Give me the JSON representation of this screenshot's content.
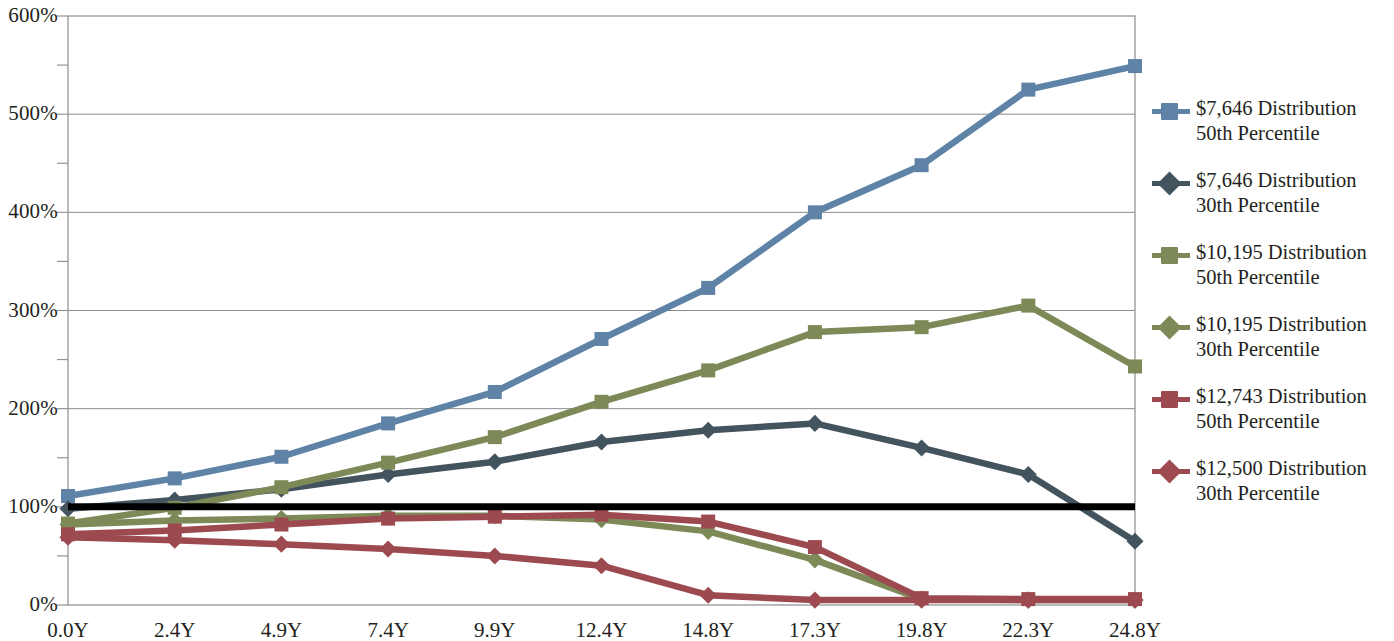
{
  "chart_data": {
    "type": "line",
    "title": "",
    "subtitle": "",
    "xlabel": "",
    "ylabel": "",
    "grid": true,
    "legend_position": "right",
    "ylim": [
      0,
      600
    ],
    "y_unit": "%",
    "y_ticks": [
      "0%",
      "100%",
      "200%",
      "300%",
      "400%",
      "500%",
      "600%"
    ],
    "y_tick_values": [
      0,
      100,
      200,
      300,
      400,
      500,
      600
    ],
    "y_minor_ticks": [
      50,
      150,
      250,
      350,
      450,
      550
    ],
    "categories": [
      "0.0Y",
      "2.4Y",
      "4.9Y",
      "7.4Y",
      "9.9Y",
      "12.4Y",
      "14.8Y",
      "17.3Y",
      "19.8Y",
      "22.3Y",
      "24.8Y"
    ],
    "reference_line": {
      "value": 100,
      "label": "100%",
      "color": "#000000"
    },
    "series": [
      {
        "name": "$7,646 Distribution 50th Percentile",
        "legend_line1": "$7,646 Distribution",
        "legend_line2": "50th Percentile",
        "color": "#5e83a6",
        "marker": "square",
        "values": [
          111,
          129,
          151,
          185,
          217,
          271,
          323,
          400,
          448,
          525,
          549
        ]
      },
      {
        "name": "$7,646 Distribution 30th Percentile",
        "legend_line1": "$7,646 Distribution",
        "legend_line2": "30th Percentile",
        "color": "#44545f",
        "marker": "diamond",
        "values": [
          98,
          107,
          118,
          133,
          146,
          166,
          178,
          185,
          160,
          133,
          65
        ]
      },
      {
        "name": "$10,195 Distribution 50th Percentile",
        "legend_line1": "$10,195 Distribution",
        "legend_line2": "50th Percentile",
        "color": "#7d8a58",
        "marker": "square",
        "values": [
          83,
          99,
          120,
          145,
          171,
          207,
          239,
          278,
          283,
          305,
          243
        ]
      },
      {
        "name": "$10,195 Distribution 30th Percentile",
        "legend_line1": "$10,195 Distribution",
        "legend_line2": "30th Percentile",
        "color": "#7d8a58",
        "marker": "diamond",
        "values": [
          82,
          86,
          88,
          91,
          91,
          87,
          75,
          46,
          6,
          5,
          5
        ]
      },
      {
        "name": "$12,743 Distribution 50th Percentile",
        "legend_line1": "$12,743 Distribution",
        "legend_line2": "50th Percentile",
        "color": "#9c4a50",
        "marker": "square",
        "values": [
          72,
          76,
          82,
          88,
          90,
          92,
          85,
          59,
          7,
          6,
          6
        ]
      },
      {
        "name": "$12,500 Distribution 30th Percentile",
        "legend_line1": "$12,500 Distribution",
        "legend_line2": "30th Percentile",
        "color": "#9c4a50",
        "marker": "diamond",
        "values": [
          69,
          66,
          62,
          57,
          50,
          40,
          10,
          5,
          5,
          5,
          5
        ]
      }
    ]
  }
}
